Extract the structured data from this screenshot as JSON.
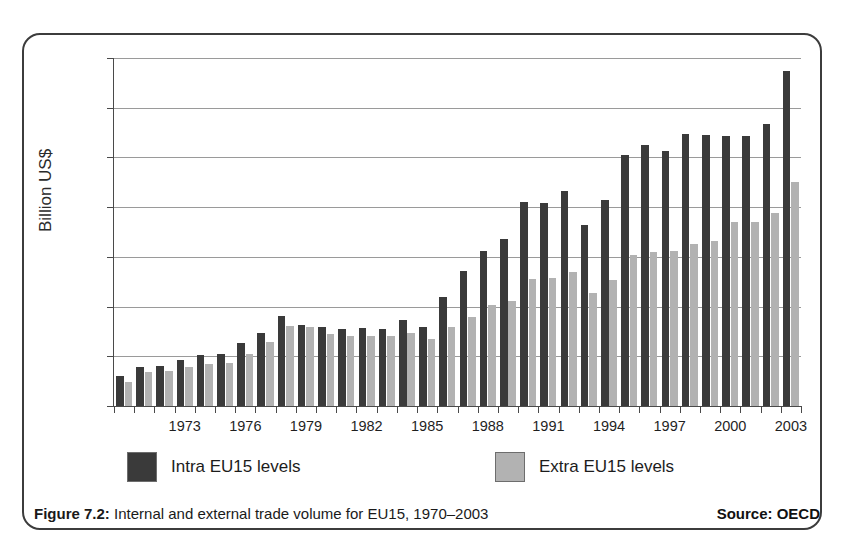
{
  "figure": {
    "caption_label": "Figure 7.2:",
    "caption_text": " Internal and external trade volume for EU15, 1970–2003",
    "source": "Source: OECD"
  },
  "legend": {
    "intra_label": "Intra EU15 levels",
    "extra_label": "Extra EU15 levels"
  },
  "colors": {
    "intra": "#3a3a3a",
    "extra": "#b2b2b2",
    "axis": "#4a4a4a",
    "grid": "#9a9a9a",
    "frame": "#3c3c3c"
  },
  "chart_data": {
    "type": "bar",
    "title": "Internal and external trade volume for EU15, 1970–2003",
    "xlabel": "",
    "ylabel": "Billion US$",
    "ylim": [
      0,
      3500
    ],
    "ytick_values": [
      0,
      500,
      1000,
      1500,
      2000,
      2500,
      3000,
      3500
    ],
    "ytick_labels": [
      "0",
      "500",
      "1000",
      "1500",
      "2000",
      "2500",
      "3000",
      "3500"
    ],
    "grid": true,
    "legend_position": "below-axes",
    "categories": [
      "1970",
      "1971",
      "1972",
      "1973",
      "1974",
      "1975",
      "1976",
      "1977",
      "1978",
      "1979",
      "1980",
      "1981",
      "1982",
      "1983",
      "1984",
      "1985",
      "1986",
      "1987",
      "1988",
      "1989",
      "1990",
      "1991",
      "1992",
      "1993",
      "1994",
      "1995",
      "1996",
      "1997",
      "1998",
      "1999",
      "2000",
      "2001",
      "2002",
      "2003"
    ],
    "xtick_labels": [
      "1973",
      "1976",
      "1979",
      "1982",
      "1985",
      "1988",
      "1991",
      "1994",
      "1997",
      "2000",
      "2003"
    ],
    "series": [
      {
        "name": "Intra EU15 levels",
        "color": "#3a3a3a",
        "values": [
          300,
          390,
          400,
          460,
          515,
          520,
          630,
          735,
          910,
          810,
          790,
          775,
          780,
          775,
          865,
          790,
          1100,
          1355,
          1560,
          1680,
          2050,
          2045,
          2160,
          1820,
          2070,
          2520,
          2625,
          2565,
          2740,
          2730,
          2715,
          2715,
          2835,
          3370
        ]
      },
      {
        "name": "Extra EU15 levels",
        "color": "#b2b2b2",
        "values": [
          240,
          340,
          355,
          395,
          420,
          430,
          525,
          640,
          800,
          790,
          725,
          705,
          700,
          705,
          735,
          670,
          790,
          900,
          1020,
          1060,
          1280,
          1285,
          1345,
          1140,
          1265,
          1520,
          1545,
          1555,
          1625,
          1660,
          1855,
          1855,
          1940,
          2250
        ]
      }
    ]
  }
}
